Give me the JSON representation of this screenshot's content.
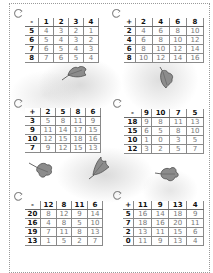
{
  "worksheet": {
    "tables": [
      {
        "operator": "-",
        "columns": [
          "1",
          "2",
          "3",
          "4"
        ],
        "rows": [
          {
            "label": "5",
            "values": [
              "4",
              "3",
              "2",
              "1"
            ]
          },
          {
            "label": "6",
            "values": [
              "5",
              "4",
              "3",
              "2"
            ]
          },
          {
            "label": "7",
            "values": [
              "6",
              "5",
              "4",
              "3"
            ]
          },
          {
            "label": "8",
            "values": [
              "7",
              "6",
              "5",
              "4"
            ]
          }
        ]
      },
      {
        "operator": "+",
        "columns": [
          "2",
          "4",
          "6",
          "8"
        ],
        "rows": [
          {
            "label": "2",
            "values": [
              "4",
              "6",
              "8",
              "10"
            ]
          },
          {
            "label": "4",
            "values": [
              "6",
              "8",
              "10",
              "12"
            ]
          },
          {
            "label": "6",
            "values": [
              "8",
              "10",
              "12",
              "14"
            ]
          },
          {
            "label": "8",
            "values": [
              "10",
              "12",
              "14",
              "16"
            ]
          }
        ]
      },
      {
        "operator": "+",
        "columns": [
          "2",
          "5",
          "8",
          "6"
        ],
        "rows": [
          {
            "label": "3",
            "values": [
              "5",
              "8",
              "11",
              "9"
            ]
          },
          {
            "label": "9",
            "values": [
              "11",
              "14",
              "17",
              "15"
            ]
          },
          {
            "label": "10",
            "values": [
              "12",
              "15",
              "18",
              "16"
            ]
          },
          {
            "label": "7",
            "values": [
              "9",
              "12",
              "15",
              "13"
            ]
          }
        ]
      },
      {
        "operator": "-",
        "columns": [
          "9",
          "10",
          "7",
          "5"
        ],
        "rows": [
          {
            "label": "18",
            "values": [
              "9",
              "8",
              "11",
              "13"
            ]
          },
          {
            "label": "15",
            "values": [
              "6",
              "5",
              "8",
              "10"
            ]
          },
          {
            "label": "10",
            "values": [
              "1",
              "0",
              "3",
              "5"
            ]
          },
          {
            "label": "12",
            "values": [
              "3",
              "2",
              "5",
              "7"
            ]
          }
        ]
      },
      {
        "operator": "-",
        "columns": [
          "12",
          "8",
          "11",
          "6"
        ],
        "rows": [
          {
            "label": "20",
            "values": [
              "8",
              "12",
              "9",
              "14"
            ]
          },
          {
            "label": "16",
            "values": [
              "4",
              "8",
              "5",
              "10"
            ]
          },
          {
            "label": "19",
            "values": [
              "7",
              "11",
              "8",
              "13"
            ]
          },
          {
            "label": "13",
            "values": [
              "1",
              "5",
              "2",
              "7"
            ]
          }
        ]
      },
      {
        "operator": "+",
        "columns": [
          "11",
          "9",
          "13",
          "4"
        ],
        "rows": [
          {
            "label": "5",
            "values": [
              "16",
              "14",
              "18",
              "9"
            ]
          },
          {
            "label": "7",
            "values": [
              "18",
              "16",
              "20",
              "11"
            ]
          },
          {
            "label": "2",
            "values": [
              "13",
              "11",
              "15",
              "6"
            ]
          },
          {
            "label": "0",
            "values": [
              "11",
              "9",
              "13",
              "4"
            ]
          }
        ]
      }
    ],
    "colors": {
      "header_text": "#111111",
      "answer_text": "#777777",
      "grid_line": "#8a8a8a",
      "leaf_fill": "#8c8c8c"
    }
  }
}
